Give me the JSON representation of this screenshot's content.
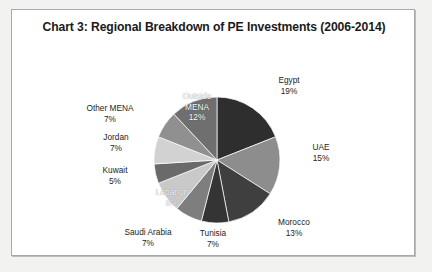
{
  "chart_data": {
    "type": "pie",
    "title": "Chart 3: Regional Breakdown of PE Investments (2006-2014)",
    "xlabel": "",
    "ylabel": "",
    "legend_position": "none",
    "grid": false,
    "labels_show_percent": true,
    "categories": [
      "Egypt",
      "UAE",
      "Morocco",
      "Tunisia",
      "Saudi Arabia",
      "Lebanon",
      "Kuwait",
      "Jordan",
      "Other MENA",
      "Outside MENA"
    ],
    "values": [
      19,
      15,
      13,
      7,
      7,
      8,
      5,
      7,
      7,
      12
    ],
    "slices": [
      {
        "name": "Egypt",
        "value": 19,
        "percent_label": "19%",
        "color": "#2e2e2e",
        "label_position": "outside"
      },
      {
        "name": "UAE",
        "value": 15,
        "percent_label": "15%",
        "color": "#8d8d8d",
        "label_position": "outside"
      },
      {
        "name": "Morocco",
        "value": 13,
        "percent_label": "13%",
        "color": "#3f3f3f",
        "label_position": "outside"
      },
      {
        "name": "Tunisia",
        "value": 7,
        "percent_label": "7%",
        "color": "#343434",
        "label_position": "outside"
      },
      {
        "name": "Saudi Arabia",
        "value": 7,
        "percent_label": "7%",
        "color": "#7e7e7e",
        "label_position": "outside"
      },
      {
        "name": "Lebanon",
        "value": 8,
        "percent_label": "8%",
        "color": "#c9c9c9",
        "label_position": "inside"
      },
      {
        "name": "Kuwait",
        "value": 5,
        "percent_label": "5%",
        "color": "#6a6a6a",
        "label_position": "outside"
      },
      {
        "name": "Jordan",
        "value": 7,
        "percent_label": "7%",
        "color": "#d2d2d2",
        "label_position": "outside"
      },
      {
        "name": "Other MENA",
        "value": 7,
        "percent_label": "7%",
        "color": "#909090",
        "label_position": "outside"
      },
      {
        "name": "Outside MENA",
        "value": 12,
        "percent_label": "12%",
        "color": "#6f6f6f",
        "label_position": "inside"
      }
    ]
  },
  "labels": {
    "egypt": {
      "name": "Egypt",
      "pct": "19%"
    },
    "uae": {
      "name": "UAE",
      "pct": "15%"
    },
    "morocco": {
      "name": "Morocco",
      "pct": "13%"
    },
    "tunisia": {
      "name": "Tunisia",
      "pct": "7%"
    },
    "saudi_arabia": {
      "name": "Saudi Arabia",
      "pct": "7%"
    },
    "lebanon": {
      "name": "Lebanon",
      "pct": "8%"
    },
    "kuwait": {
      "name": "Kuwait",
      "pct": "5%"
    },
    "jordan": {
      "name": "Jordan",
      "pct": "7%"
    },
    "other_mena": {
      "name": "Other MENA",
      "pct": "7%"
    },
    "outside_mena": {
      "name": "Outside MENA",
      "pct_line1": "Outside",
      "pct_line2": "MENA",
      "pct": "12%"
    }
  }
}
